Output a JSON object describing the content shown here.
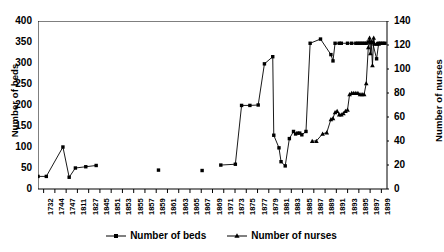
{
  "chart_data": {
    "type": "line",
    "title": "",
    "xlabel": "",
    "ylabel": "Number of beds",
    "y2label": "Number of nurses",
    "ylim": [
      0,
      400
    ],
    "y2lim": [
      0,
      140
    ],
    "yticks": [
      0,
      50,
      100,
      150,
      200,
      250,
      300,
      350,
      400
    ],
    "y2ticks": [
      0,
      20,
      40,
      60,
      80,
      100,
      120,
      140
    ],
    "grid": false,
    "legend_position": "bottom",
    "categories": [
      "1732",
      "1744",
      "1747",
      "1811",
      "1827",
      "1845",
      "1851",
      "1853",
      "1855",
      "1857",
      "1859",
      "1861",
      "1863",
      "1865",
      "1867",
      "1869",
      "1971",
      "1873",
      "1875",
      "1877",
      "1879",
      "1881",
      "1883",
      "1885",
      "1887",
      "1889",
      "1891",
      "1893",
      "1895",
      "1897",
      "1899"
    ],
    "x": [
      1732,
      1744,
      1747,
      1811,
      1827,
      1845,
      1851,
      1853,
      1855,
      1857,
      1859,
      1861,
      1863,
      1865,
      1867,
      1869,
      1871,
      1873,
      1875,
      1877,
      1879,
      1881,
      1883,
      1885,
      1887,
      1889,
      1891,
      1893,
      1895,
      1897,
      1899
    ],
    "series": [
      {
        "name": "Number of beds",
        "axis": "left",
        "marker": "square",
        "points": [
          {
            "x": 1732,
            "y": 30
          },
          {
            "x": 1736,
            "y": 30
          },
          {
            "x": 1744,
            "y": 100
          },
          {
            "x": 1747,
            "y": 28
          },
          {
            "x": 1750,
            "y": 50
          },
          {
            "x": 1755,
            "y": 53
          },
          {
            "x": 1760,
            "y": 56
          },
          {
            "x": 1790,
            "y": 45
          },
          {
            "x": 1811,
            "y": 44
          },
          {
            "x": 1820,
            "y": 57
          },
          {
            "x": 1827,
            "y": 59
          },
          {
            "x": 1830,
            "y": 199
          },
          {
            "x": 1834,
            "y": 199
          },
          {
            "x": 1838,
            "y": 200
          },
          {
            "x": 1841,
            "y": 298
          },
          {
            "x": 1845,
            "y": 315
          },
          {
            "x": 1845.5,
            "y": 128
          },
          {
            "x": 1848,
            "y": 98
          },
          {
            "x": 1849,
            "y": 65
          },
          {
            "x": 1851,
            "y": 55
          },
          {
            "x": 1853,
            "y": 120
          },
          {
            "x": 1855,
            "y": 137
          },
          {
            "x": 1856,
            "y": 131
          },
          {
            "x": 1857,
            "y": 133
          },
          {
            "x": 1858,
            "y": 133
          },
          {
            "x": 1859,
            "y": 129
          },
          {
            "x": 1861,
            "y": 137
          },
          {
            "x": 1863,
            "y": 347
          },
          {
            "x": 1868,
            "y": 357
          },
          {
            "x": 1873,
            "y": 320
          },
          {
            "x": 1874,
            "y": 305
          },
          {
            "x": 1875,
            "y": 347
          },
          {
            "x": 1877,
            "y": 347
          },
          {
            "x": 1878,
            "y": 347
          },
          {
            "x": 1881,
            "y": 347
          },
          {
            "x": 1883,
            "y": 347
          },
          {
            "x": 1885,
            "y": 347
          },
          {
            "x": 1886,
            "y": 347
          },
          {
            "x": 1887,
            "y": 347
          },
          {
            "x": 1888,
            "y": 347
          },
          {
            "x": 1889,
            "y": 347
          },
          {
            "x": 1890,
            "y": 347
          },
          {
            "x": 1891,
            "y": 350
          },
          {
            "x": 1892,
            "y": 350
          },
          {
            "x": 1893,
            "y": 350
          },
          {
            "x": 1895,
            "y": 310
          },
          {
            "x": 1896,
            "y": 347
          },
          {
            "x": 1897,
            "y": 347
          },
          {
            "x": 1898,
            "y": 347
          },
          {
            "x": 1899,
            "y": 347
          }
        ]
      },
      {
        "name": "Number of nurses",
        "axis": "right",
        "marker": "triangle",
        "points": [
          {
            "x": 1864,
            "y": 40
          },
          {
            "x": 1866,
            "y": 40
          },
          {
            "x": 1869,
            "y": 46
          },
          {
            "x": 1871,
            "y": 47
          },
          {
            "x": 1873,
            "y": 58
          },
          {
            "x": 1874,
            "y": 59
          },
          {
            "x": 1875,
            "y": 64
          },
          {
            "x": 1876,
            "y": 65
          },
          {
            "x": 1877,
            "y": 62
          },
          {
            "x": 1878,
            "y": 62
          },
          {
            "x": 1879,
            "y": 63
          },
          {
            "x": 1880,
            "y": 65
          },
          {
            "x": 1881,
            "y": 66
          },
          {
            "x": 1882,
            "y": 79
          },
          {
            "x": 1883,
            "y": 80
          },
          {
            "x": 1884,
            "y": 80
          },
          {
            "x": 1885,
            "y": 80
          },
          {
            "x": 1886,
            "y": 80
          },
          {
            "x": 1887,
            "y": 79
          },
          {
            "x": 1888,
            "y": 79
          },
          {
            "x": 1889,
            "y": 79
          },
          {
            "x": 1890,
            "y": 88
          },
          {
            "x": 1891,
            "y": 118
          },
          {
            "x": 1891.6,
            "y": 126
          },
          {
            "x": 1892,
            "y": 113
          },
          {
            "x": 1892.4,
            "y": 122
          },
          {
            "x": 1893,
            "y": 103
          },
          {
            "x": 1893.6,
            "y": 126
          },
          {
            "x": 1894,
            "y": 121
          },
          {
            "x": 1895,
            "y": 121
          },
          {
            "x": 1896,
            "y": 121
          }
        ]
      }
    ],
    "legend": [
      "Number of beds",
      "Number of nurses"
    ]
  },
  "axes": {
    "left_title": "Number of beds",
    "right_title": "Number of nurses"
  },
  "legend": {
    "beds_label": "Number of beds",
    "nurses_label": "Number of nurses"
  },
  "colors": {
    "series": "#000000",
    "axis": "#000000",
    "background": "#ffffff"
  }
}
